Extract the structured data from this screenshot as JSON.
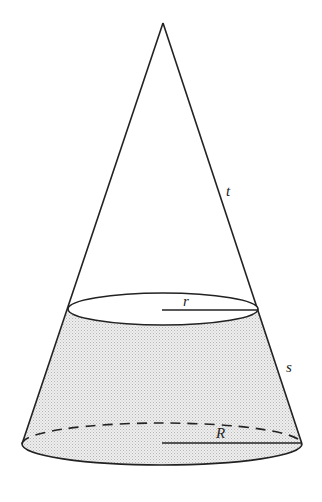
{
  "diagram": {
    "labels": {
      "upper_slant": "t",
      "top_radius": "r",
      "frustum_slant": "s",
      "base_radius": "R"
    },
    "colors": {
      "stroke": "#222222",
      "shade": "#d9d9d9",
      "background": "#ffffff"
    },
    "geometry": {
      "apex": [
        163,
        23
      ],
      "top_ellipse": {
        "cx": 163,
        "cy": 309,
        "rx": 95,
        "ry": 16
      },
      "base_ellipse": {
        "cx": 162,
        "cy": 444,
        "rx": 140,
        "ry": 21
      }
    }
  }
}
